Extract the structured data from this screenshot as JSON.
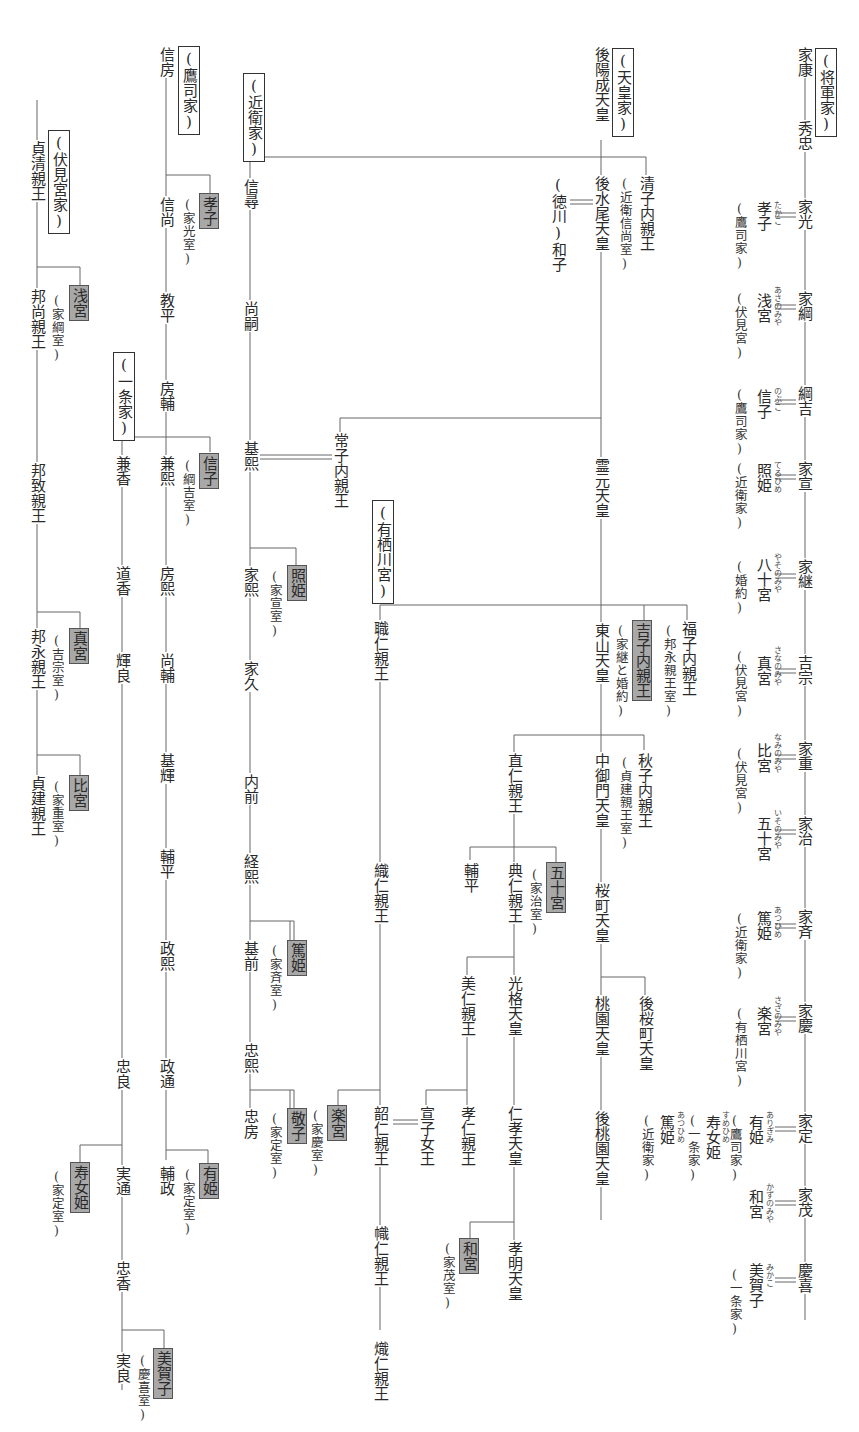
{
  "houses": {
    "shogun": "(将軍家)",
    "tenno": "(天皇家)",
    "konoe": "(近衛家)",
    "takatsukasa": "(鷹司家)",
    "ichijo": "(一条家)",
    "fushimi": "(伏見宮家)",
    "arisugawa": "(有栖川宮)"
  },
  "shogun_line": {
    "members": [
      "家康",
      "秀忠",
      "家光",
      "家綱",
      "綱吉",
      "家宣",
      "家継",
      "吉宗",
      "家重",
      "家治",
      "家斉",
      "家慶",
      "家定",
      "家茂",
      "慶喜"
    ],
    "spouses": [
      {
        "of": "家光",
        "name": "孝子",
        "ruby": "たかこ",
        "origin": "(鷹司家)"
      },
      {
        "of": "家綱",
        "name": "浅宮",
        "ruby": "あさのみや",
        "origin": "(伏見宮)"
      },
      {
        "of": "綱吉",
        "name": "信子",
        "ruby": "のぶこ",
        "origin": "(鷹司家)"
      },
      {
        "of": "家宣",
        "name": "照姫",
        "ruby": "てるひめ",
        "origin": "(近衛家)"
      },
      {
        "of": "家継",
        "name": "八十宮",
        "ruby": "やそのみや",
        "origin": "(婚約)"
      },
      {
        "of": "吉宗",
        "name": "真宮",
        "ruby": "さなのみや",
        "origin": "(伏見宮)"
      },
      {
        "of": "家重",
        "name": "比宮",
        "ruby": "なみのみや",
        "origin": "(伏見宮)"
      },
      {
        "of": "家治",
        "name": "五十宮",
        "ruby": "いそのみや",
        "origin": ""
      },
      {
        "of": "家斉",
        "name": "篤姫",
        "ruby": "あつひめ",
        "origin": "(近衛家)"
      },
      {
        "of": "家慶",
        "name": "楽宮",
        "ruby": "さざのみや",
        "origin": "(有栖川宮)"
      },
      {
        "of": "家定",
        "name": "有姫",
        "ruby": "ありぎみ",
        "origin": "(鷹司家)"
      },
      {
        "of": "家定",
        "name": "寿女姫",
        "ruby": "すめひめ",
        "origin": "(一条家)"
      },
      {
        "of": "家定",
        "name": "篤姫",
        "ruby": "あつひめ",
        "origin": "(近衛家)"
      },
      {
        "of": "家茂",
        "name": "和宮",
        "ruby": "かずのみや",
        "origin": ""
      },
      {
        "of": "慶喜",
        "name": "美賀子",
        "ruby": "みかこ",
        "origin": "(一条家)"
      }
    ]
  },
  "tenno_line": {
    "nodes": [
      {
        "id": "goyozei",
        "name": "後陽成天皇"
      },
      {
        "id": "gomizuno",
        "name": "後水尾天皇"
      },
      {
        "id": "kiyoko",
        "name": "清子内親王",
        "note": "(近衛信尚室)"
      },
      {
        "id": "masako",
        "name": "(徳川)和子"
      },
      {
        "id": "reigen",
        "name": "霊元天皇"
      },
      {
        "id": "tsuneko",
        "name": "常子内親王"
      },
      {
        "id": "higashiyama",
        "name": "東山天皇"
      },
      {
        "id": "yoshiko",
        "name": "吉子内親王",
        "note": "(家継と婚約)",
        "highlight": true
      },
      {
        "id": "fukuko",
        "name": "福子内親王",
        "note": "(邦永親王室)"
      },
      {
        "id": "yorihito",
        "name": "職仁親王"
      },
      {
        "id": "naohito",
        "name": "直仁親王"
      },
      {
        "id": "nakamikado",
        "name": "中御門天皇"
      },
      {
        "id": "akiko",
        "name": "秋子内親王",
        "note": "(貞建親王室)"
      },
      {
        "id": "sukehira",
        "name": "輔平"
      },
      {
        "id": "sukehito",
        "name": "典仁親王"
      },
      {
        "id": "isonomiya",
        "name": "五十宮",
        "note": "(家治室)",
        "highlight": true
      },
      {
        "id": "sakuramachi",
        "name": "桜町天皇"
      },
      {
        "id": "yoshihito",
        "name": "美仁親王"
      },
      {
        "id": "kokaku",
        "name": "光格天皇"
      },
      {
        "id": "momozono",
        "name": "桃園天皇"
      },
      {
        "id": "gosakuramachi",
        "name": "後桜町天皇"
      },
      {
        "id": "oriito",
        "name": "織仁親王"
      },
      {
        "id": "takahito",
        "name": "孝仁親王"
      },
      {
        "id": "yoshiko2",
        "name": "宣子女王"
      },
      {
        "id": "ninko",
        "name": "仁孝天皇"
      },
      {
        "id": "gomomozono",
        "name": "後桃園天皇"
      },
      {
        "id": "tsunahito",
        "name": "韶仁親王"
      },
      {
        "id": "sazanomiya",
        "name": "楽宮",
        "note": "(家慶室)",
        "highlight": true
      },
      {
        "id": "komei",
        "name": "孝明天皇"
      },
      {
        "id": "kazunomiya",
        "name": "和宮",
        "note": "(家茂室)",
        "highlight": true
      },
      {
        "id": "takahito2",
        "name": "幟仁親王"
      },
      {
        "id": "taruhito",
        "name": "熾仁親王"
      }
    ]
  },
  "konoe_line": {
    "members": [
      "信尋",
      "尚嗣",
      "基熙",
      "家熙",
      "家久",
      "内前",
      "経熙",
      "基前",
      "忠熙",
      "忠房"
    ],
    "daughters": [
      {
        "name": "照姫",
        "note": "(家宣室)"
      },
      {
        "name": "篤姫",
        "note": "(家斉室)"
      },
      {
        "name": "敬子",
        "note": "(家定室)"
      }
    ]
  },
  "takatsukasa_line": {
    "members": [
      "信房",
      "信尚",
      "教平",
      "房輔",
      "兼熙",
      "房熙",
      "尚輔",
      "基輝",
      "輔平",
      "政熙",
      "政通",
      "輔政"
    ],
    "daughters": [
      {
        "name": "孝子",
        "note": "(家光室)"
      },
      {
        "name": "信子",
        "note": "(綱吉室)"
      },
      {
        "name": "有姫",
        "note": "(家定室)"
      }
    ]
  },
  "ichijo_line": {
    "members": [
      "兼香",
      "道香",
      "輝良",
      "忠良",
      "実通",
      "忠香",
      "実良"
    ],
    "daughters": [
      {
        "name": "寿女姫",
        "note": "(家定室)"
      },
      {
        "name": "美賀子",
        "note": "(慶喜室)"
      }
    ]
  },
  "fushimi_line": {
    "members": [
      "貞清親王",
      "邦尚親王",
      "邦致親王",
      "邦永親王",
      "貞建親王"
    ],
    "daughters": [
      {
        "name": "浅宮",
        "note": "(家綱室)"
      },
      {
        "name": "真宮",
        "note": "(吉宗室)"
      },
      {
        "name": "比宮",
        "note": "(家重室)"
      }
    ]
  },
  "colors": {
    "highlight": "#a8a8a8",
    "line": "#555555",
    "text": "#2a2a2a",
    "background": "#ffffff"
  }
}
